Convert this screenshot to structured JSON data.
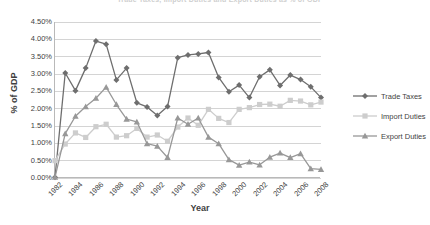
{
  "chart_data": {
    "type": "line",
    "title": "Trade Taxes, Import Duties and Export Duties as % of GDP",
    "xlabel": "Year",
    "ylabel": "% of GDP",
    "ylim": [
      0,
      4.5
    ],
    "ytick_values": [
      0,
      0.5,
      1.0,
      1.5,
      2.0,
      2.5,
      3.0,
      3.5,
      4.0,
      4.5
    ],
    "ytick_labels": [
      "0.00%",
      "0.50%",
      "1.00%",
      "1.50%",
      "2.00%",
      "2.50%",
      "3.00%",
      "3.50%",
      "4.00%",
      "4.50%"
    ],
    "grid": true,
    "legend_position": "right",
    "x": [
      1982,
      1983,
      1984,
      1985,
      1986,
      1987,
      1988,
      1989,
      1990,
      1991,
      1992,
      1993,
      1994,
      1995,
      1996,
      1997,
      1998,
      1999,
      2000,
      2001,
      2002,
      2003,
      2004,
      2005,
      2006,
      2007,
      2008
    ],
    "xtick_labels": [
      "1982",
      "1984",
      "1986",
      "1988",
      "1990",
      "1992",
      "1994",
      "1996",
      "1998",
      "2000",
      "2002",
      "2004",
      "2006",
      "2008"
    ],
    "series": [
      {
        "name": "Trade Taxes",
        "color": "#6e6e6e",
        "marker": "diamond",
        "values": [
          0.02,
          3.03,
          2.52,
          3.17,
          3.95,
          3.86,
          2.83,
          3.17,
          2.17,
          2.05,
          1.8,
          2.06,
          3.47,
          3.55,
          3.58,
          3.62,
          2.9,
          2.49,
          2.68,
          2.32,
          2.92,
          3.12,
          2.67,
          2.97,
          2.84,
          2.63,
          2.32
        ]
      },
      {
        "name": "Import Duties",
        "color": "#cdcdcd",
        "marker": "square",
        "values": [
          0.5,
          0.98,
          1.3,
          1.17,
          1.48,
          1.55,
          1.18,
          1.22,
          1.43,
          1.18,
          1.24,
          1.06,
          1.47,
          1.73,
          1.52,
          1.98,
          1.72,
          1.6,
          1.98,
          2.03,
          2.12,
          2.13,
          2.07,
          2.24,
          2.22,
          2.11,
          2.19
        ]
      },
      {
        "name": "Export Duties",
        "color": "#989898",
        "marker": "triangle",
        "values": [
          0.02,
          1.28,
          1.78,
          2.06,
          2.3,
          2.62,
          2.12,
          1.7,
          1.62,
          0.99,
          0.92,
          0.59,
          1.73,
          1.55,
          1.73,
          1.18,
          0.99,
          0.53,
          0.37,
          0.46,
          0.38,
          0.6,
          0.72,
          0.59,
          0.7,
          0.27,
          0.25
        ]
      }
    ]
  }
}
